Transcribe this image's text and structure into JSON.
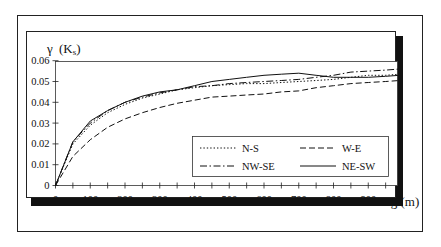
{
  "chart_data": {
    "type": "line",
    "title": "",
    "ylabel": "γ (Ks)",
    "xlabel": "Lag (m)",
    "xlim": [
      0,
      990
    ],
    "ylim": [
      0,
      0.06
    ],
    "x_ticks": [
      0,
      100,
      200,
      300,
      400,
      500,
      600,
      700,
      800,
      900
    ],
    "x_tick_labels": [
      "0",
      "100",
      "200",
      "300",
      "400",
      "500",
      "600",
      "700",
      "800",
      "900"
    ],
    "y_ticks": [
      0,
      0.01,
      0.02,
      0.03,
      0.04,
      0.05,
      0.06
    ],
    "y_tick_labels": [
      "0",
      "0.01",
      "0.02",
      "0.03",
      "0.04",
      "0.05",
      "0.06"
    ],
    "grid": false,
    "legend_position": "lower right (inside plot)",
    "x": [
      0,
      50,
      100,
      150,
      200,
      250,
      300,
      350,
      400,
      450,
      500,
      550,
      600,
      650,
      700,
      750,
      800,
      850,
      900,
      950,
      990
    ],
    "series": [
      {
        "name": "N-S",
        "style": "dotted",
        "values": [
          0,
          0.02,
          0.029,
          0.035,
          0.039,
          0.042,
          0.044,
          0.046,
          0.047,
          0.048,
          0.0485,
          0.049,
          0.049,
          0.0495,
          0.05,
          0.0505,
          0.051,
          0.052,
          0.053,
          0.053,
          0.0535
        ]
      },
      {
        "name": "W-E",
        "style": "dashed",
        "values": [
          0,
          0.014,
          0.022,
          0.028,
          0.032,
          0.035,
          0.0375,
          0.0395,
          0.041,
          0.0425,
          0.043,
          0.0435,
          0.044,
          0.045,
          0.0455,
          0.047,
          0.048,
          0.049,
          0.0495,
          0.05,
          0.0505
        ]
      },
      {
        "name": "NW-SE",
        "style": "dash-dot",
        "values": [
          0,
          0.021,
          0.03,
          0.036,
          0.04,
          0.0425,
          0.0445,
          0.046,
          0.0475,
          0.048,
          0.049,
          0.0495,
          0.05,
          0.0505,
          0.051,
          0.052,
          0.053,
          0.0545,
          0.055,
          0.0555,
          0.056
        ]
      },
      {
        "name": "NE-SW",
        "style": "solid",
        "values": [
          0,
          0.021,
          0.031,
          0.036,
          0.04,
          0.043,
          0.045,
          0.046,
          0.048,
          0.05,
          0.051,
          0.052,
          0.053,
          0.0535,
          0.054,
          0.053,
          0.052,
          0.052,
          0.052,
          0.0525,
          0.053
        ]
      }
    ]
  },
  "axes": {
    "y_title_symbol": "γ",
    "y_title_units": "(K",
    "y_title_subscript": "s",
    "y_title_close": ")",
    "x_title": "Lag (m)"
  },
  "legend": [
    {
      "label": "N-S",
      "style": "dotted"
    },
    {
      "label": "W-E",
      "style": "dashed"
    },
    {
      "label": "NW-SE",
      "style": "dash-dot"
    },
    {
      "label": "NE-SW",
      "style": "solid"
    }
  ],
  "colors": {
    "line": "#111111",
    "background": "#ffffff",
    "shadow": "#111111"
  }
}
